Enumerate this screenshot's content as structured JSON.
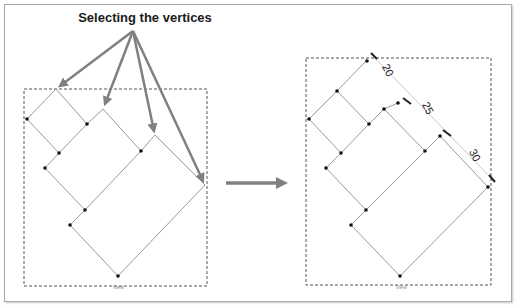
{
  "title": "Selecting the vertices",
  "colors": {
    "background": "#ffffff",
    "frame_border": "#a8a8a8",
    "arrow": "#808080",
    "edge": "#9a9a9a",
    "vertex": "#111111",
    "dashed_box": "#555555"
  },
  "left_panel": {
    "label": "View",
    "description": "Rotated stepped outline with selected vertices"
  },
  "right_panel": {
    "label": "View",
    "dimensions": [
      "20",
      "25",
      "30"
    ]
  },
  "transition_arrow": "right-arrow"
}
